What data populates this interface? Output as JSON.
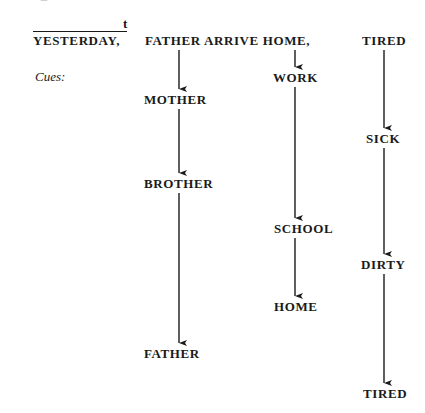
{
  "header": {
    "gloss": "YESTERDAY,",
    "topic_marker": "t",
    "sentence_rest": "FATHER ARRIVE HOME,",
    "final_word": "TIRED"
  },
  "cues_label": "Cues:",
  "columns": [
    {
      "name": "father-column",
      "items": [
        "MOTHER",
        "BROTHER",
        "FATHER"
      ]
    },
    {
      "name": "home-column",
      "items": [
        "WORK",
        "SCHOOL",
        "HOME"
      ]
    },
    {
      "name": "tired-column",
      "items": [
        "SICK",
        "DIRTY",
        "TIRED"
      ]
    }
  ]
}
